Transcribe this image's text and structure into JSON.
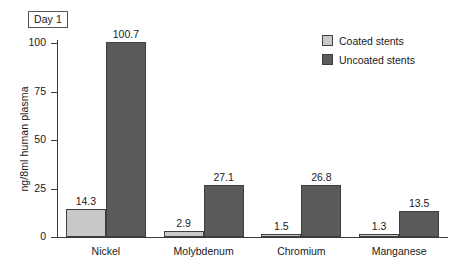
{
  "badge": {
    "label": "Day 1"
  },
  "legend": {
    "position": "top-right",
    "entries": [
      {
        "label": "Coated stents",
        "swatch": "legend-swatch-coated",
        "color": "#c8c8c8"
      },
      {
        "label": "Uncoated stents",
        "swatch": "legend-swatch-uncoated",
        "color": "#5a5a5a"
      }
    ]
  },
  "axes": {
    "y_title": "ng/8ml human plasma",
    "y_ticks": [
      "0",
      "25",
      "50",
      "75",
      "100"
    ],
    "x_categories": [
      "Nickel",
      "Molybdenum",
      "Chromium",
      "Manganese"
    ]
  },
  "chart_data": {
    "type": "bar",
    "title": "Day 1",
    "xlabel": "",
    "ylabel": "ng/8ml human plasma",
    "categories": [
      "Nickel",
      "Molybdenum",
      "Chromium",
      "Manganese"
    ],
    "series": [
      {
        "name": "Coated stents",
        "color": "#c8c8c8",
        "values": [
          14.3,
          2.9,
          1.5,
          1.3
        ],
        "labels": [
          "14.3",
          "2.9",
          "1.5",
          "1.3"
        ]
      },
      {
        "name": "Uncoated stents",
        "color": "#5a5a5a",
        "values": [
          100.7,
          27.1,
          26.8,
          13.5
        ],
        "labels": [
          "100.7",
          "27.1",
          "26.8",
          "13.5"
        ]
      }
    ],
    "ylim": [
      0,
      112
    ],
    "yticks": [
      0,
      25,
      50,
      75,
      100
    ],
    "grid": false,
    "legend_position": "top-right",
    "value_labels": true
  }
}
